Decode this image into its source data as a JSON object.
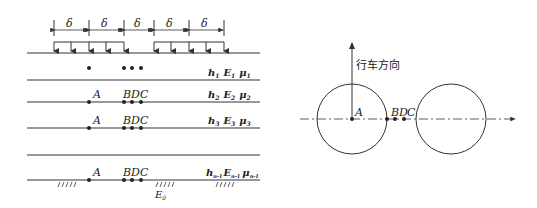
{
  "left_diagram": {
    "dimension_label": "δ",
    "dimension_count": 5,
    "layers": [
      {
        "h": "h",
        "h_sub": "1",
        "E": "E",
        "E_sub": "1",
        "mu": "μ",
        "mu_sub": "1"
      },
      {
        "h": "h",
        "h_sub": "2",
        "E": "E",
        "E_sub": "2",
        "mu": "μ",
        "mu_sub": "2"
      },
      {
        "h": "h",
        "h_sub": "3",
        "E": "E",
        "E_sub": "3",
        "mu": "μ",
        "mu_sub": "3"
      },
      {
        "h": "h",
        "h_sub": "n-1",
        "E": "E",
        "E_sub": "n-1",
        "mu": "μ",
        "mu_sub": "n-1"
      }
    ],
    "points": {
      "a": "A",
      "b": "B",
      "d": "D",
      "c": "C"
    },
    "subgrade": {
      "E": "E",
      "E_sub": "0"
    }
  },
  "right_diagram": {
    "direction_label": "行车方向",
    "points": {
      "a": "A",
      "b": "B",
      "d": "D",
      "c": "C"
    }
  },
  "colors": {
    "stroke": "#333333",
    "background": "#ffffff"
  }
}
